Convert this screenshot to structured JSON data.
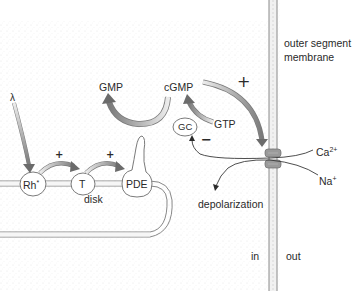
{
  "diagram": {
    "type": "phototransduction-cascade",
    "colors": {
      "background": "#ffffff",
      "stipple": "#e6e6e6",
      "outline": "#6b6b6b",
      "arrow_fill_dark": "#8a8a8a",
      "arrow_fill_light": "#e4e4e4",
      "channel": "#9a9a9a",
      "text": "#2a2a2a"
    },
    "labels": {
      "lambda": "λ",
      "rhodopsin": "Rh",
      "rhodopsin_sup": "*",
      "transducin": "T",
      "pde": "PDE",
      "gmp": "GMP",
      "cgmp": "cGMP",
      "gc": "GC",
      "gtp": "GTP",
      "disk": "disk",
      "membrane": "outer segment membrane",
      "membrane_line1": "outer segment",
      "membrane_line2": "membrane",
      "calcium": "Ca",
      "calcium_sup": "2+",
      "sodium": "Na",
      "sodium_sup": "+",
      "depolarization": "depolarization",
      "inside": "in",
      "outside": "out",
      "plus_rh_t": "+",
      "plus_t_pde": "+",
      "plus_cgmp_channel": "+",
      "minus_ca_gc": "−"
    }
  }
}
